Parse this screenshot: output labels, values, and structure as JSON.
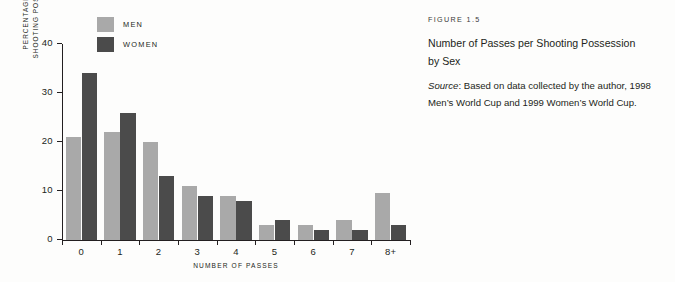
{
  "chart_data": {
    "type": "bar",
    "title": "Number of Passes per Shooting Possession by Sex",
    "xlabel": "NUMBER OF PASSES",
    "ylabel": "PERCENTAGE OF ALL SHOOTING POSSESSIONS",
    "ylabel_line1": "PERCENTAGE OF ALL",
    "ylabel_line2": "SHOOTING POSSESSIONS",
    "categories": [
      "0",
      "1",
      "2",
      "3",
      "4",
      "5",
      "6",
      "7",
      "8+"
    ],
    "series": [
      {
        "name": "MEN",
        "color": "#a9a9a9",
        "values": [
          21,
          22,
          20,
          11,
          9,
          3,
          3,
          4,
          9.5
        ]
      },
      {
        "name": "WOMEN",
        "color": "#4b4b4b",
        "values": [
          34,
          26,
          13,
          9,
          8,
          4,
          2,
          2,
          3
        ]
      }
    ],
    "ylim": [
      0,
      40
    ],
    "yticks": [
      0,
      10,
      20,
      30,
      40
    ],
    "ytick_labels": [
      "0",
      "10",
      "20",
      "30",
      "40"
    ],
    "grid": false,
    "legend_position": "top-left"
  },
  "caption": {
    "figure_number": "FIGURE 1.5",
    "title": "Number of Passes per Shooting Possession by Sex",
    "source_label": "Source",
    "source_text": ": Based on data collected by the author, 1998 Men’s World Cup and 1999 Women’s World Cup."
  }
}
